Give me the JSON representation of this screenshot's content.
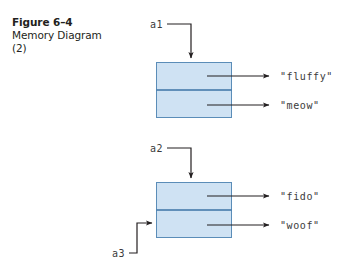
{
  "figure": {
    "caption_title": "Figure 6–4",
    "caption_line2": "Memory Diagram",
    "caption_line3": "(2)",
    "background_color": "#ffffff",
    "box_fill_color": "#cfe2f3",
    "box_stroke_color": "#5b8db8",
    "divider_color": "#3d73a6",
    "connector_color": "#231f20"
  },
  "diagrams": [
    {
      "name": "cat-object",
      "pointer_label": "a1",
      "fields": [
        {
          "value": "\"fluffy\""
        },
        {
          "value": "\"meow\""
        }
      ]
    },
    {
      "name": "dog-object",
      "pointer_label": "a2",
      "second_pointer_label": "a3",
      "fields": [
        {
          "value": "\"fido\""
        },
        {
          "value": "\"woof\""
        }
      ]
    }
  ]
}
